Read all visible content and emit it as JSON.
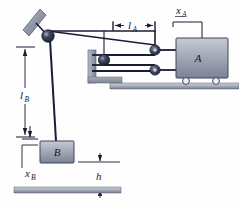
{
  "figure": {
    "type": "mechanics-diagram"
  },
  "labels": {
    "cart_body": "A",
    "block_body": "B",
    "l_a_main": "l",
    "l_a_sub": "A",
    "l_b_main": "l",
    "l_b_sub": "B",
    "x_a_main": "x",
    "x_a_sub": "A",
    "x_b_main": "x",
    "x_b_sub": "B",
    "h_main": "h"
  },
  "colors": {
    "line": "#1b1b33",
    "body_fill_light": "#b9bdc9",
    "body_fill_dark": "#6f7588",
    "pulley_dark": "#2b2f45",
    "pulley_light": "#9aa0b0",
    "ground_top": "#c3c7d1",
    "ground_bottom": "#7d8496",
    "wall_fill": "#9aa1ad",
    "bracket_fill": "#8e96a6",
    "background": "#fefefe"
  },
  "geometry": {
    "width": 239,
    "height": 210,
    "pulley_main": {
      "cx": 48,
      "cy": 36,
      "r": 6
    },
    "pulley_left_mid": {
      "cx": 104,
      "cy": 60,
      "r": 5.5
    },
    "pulley_right_top": {
      "cx": 155,
      "cy": 50,
      "r": 5
    },
    "pulley_right_bottom": {
      "cx": 155,
      "cy": 70,
      "r": 5
    },
    "cart": {
      "x": 176,
      "y": 38,
      "w": 52,
      "h": 40
    },
    "block_b": {
      "x": 40,
      "y": 141,
      "w": 34,
      "h": 22
    },
    "ground_upper": {
      "x": 110,
      "y": 83,
      "w": 129,
      "h": 6
    },
    "ground_lower": {
      "x": 14,
      "y": 187,
      "w": 107,
      "h": 6
    }
  },
  "elements": {
    "cart_wheels": 2,
    "ropes": 3,
    "pulleys": 4
  }
}
